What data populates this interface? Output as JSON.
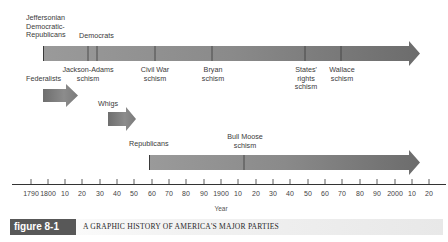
{
  "chart_data": {
    "type": "timeline",
    "title": "A GRAPHIC HISTORY OF AMERICA'S MAJOR PARTIES",
    "figure_label": "figure 8-1",
    "xlabel": "Year",
    "x_range": [
      1785,
      2025
    ],
    "ticks": [
      "1790",
      "1800",
      "10",
      "20",
      "30",
      "40",
      "50",
      "60",
      "70",
      "80",
      "90",
      "1900",
      "10",
      "20",
      "30",
      "40",
      "50",
      "60",
      "70",
      "80",
      "90",
      "2000",
      "10",
      "20"
    ],
    "parties": [
      {
        "name": "Jeffersonian Democratic-Republicans",
        "start": 1797,
        "end": 1828,
        "continues_as": "Democrats"
      },
      {
        "name": "Democrats",
        "start": 1828,
        "end": 2020,
        "ongoing": true
      },
      {
        "name": "Federalists",
        "start": 1797,
        "end": 1817
      },
      {
        "name": "Whigs",
        "start": 1834,
        "end": 1852
      },
      {
        "name": "Republicans",
        "start": 1857,
        "end": 2020,
        "ongoing": true
      }
    ],
    "schisms": [
      {
        "name": "Jackson-Adams schism",
        "year": 1824,
        "party": "Democratic-Republicans"
      },
      {
        "name": "Civil War schism",
        "year": 1860,
        "party": "Democrats"
      },
      {
        "name": "Bryan schism",
        "year": 1896,
        "party": "Democrats"
      },
      {
        "name": "States' rights schism",
        "year": 1948,
        "party": "Democrats"
      },
      {
        "name": "Wallace schism",
        "year": 1968,
        "party": "Democrats"
      },
      {
        "name": "Bull Moose schism",
        "year": 1912,
        "party": "Republicans"
      }
    ]
  },
  "labels": {
    "jeffersonian": [
      "Jeffersonian",
      "Democratic-",
      "Republicans"
    ],
    "democrats": "Democrats",
    "federalists": "Federalists",
    "whigs": "Whigs",
    "republicans": "Republicans",
    "jackson_adams": [
      "Jackson-Adams",
      "schism"
    ],
    "civil_war": [
      "Civil War",
      "schism"
    ],
    "bryan": [
      "Bryan",
      "schism"
    ],
    "states_rights": [
      "States'",
      "rights",
      "schism"
    ],
    "wallace": [
      "Wallace",
      "schism"
    ],
    "bull_moose": [
      "Bull Moose",
      "schism"
    ]
  },
  "axis": {
    "title": "Year",
    "ticks": [
      {
        "label": "1790",
        "x": 31
      },
      {
        "label": "1800",
        "x": 48
      },
      {
        "label": "10",
        "x": 65
      },
      {
        "label": "20",
        "x": 82
      },
      {
        "label": "30",
        "x": 100
      },
      {
        "label": "40",
        "x": 117
      },
      {
        "label": "50",
        "x": 134
      },
      {
        "label": "60",
        "x": 152
      },
      {
        "label": "70",
        "x": 169
      },
      {
        "label": "80",
        "x": 186
      },
      {
        "label": "90",
        "x": 204
      },
      {
        "label": "1900",
        "x": 221
      },
      {
        "label": "10",
        "x": 238
      },
      {
        "label": "20",
        "x": 256
      },
      {
        "label": "30",
        "x": 273
      },
      {
        "label": "40",
        "x": 290
      },
      {
        "label": "50",
        "x": 308
      },
      {
        "label": "60",
        "x": 325
      },
      {
        "label": "70",
        "x": 342
      },
      {
        "label": "80",
        "x": 360
      },
      {
        "label": "90",
        "x": 377
      },
      {
        "label": "2000",
        "x": 395
      },
      {
        "label": "10",
        "x": 412
      },
      {
        "label": "20",
        "x": 429
      }
    ]
  },
  "caption": {
    "figure_label": "figure 8-1",
    "title": "A GRAPHIC HISTORY OF AMERICA'S MAJOR PARTIES"
  },
  "colors": {
    "bar": "#8a8a8a",
    "bar_dark": "#6a6a6a",
    "divider": "#3a3a3a",
    "badge_bg": "#585858"
  }
}
